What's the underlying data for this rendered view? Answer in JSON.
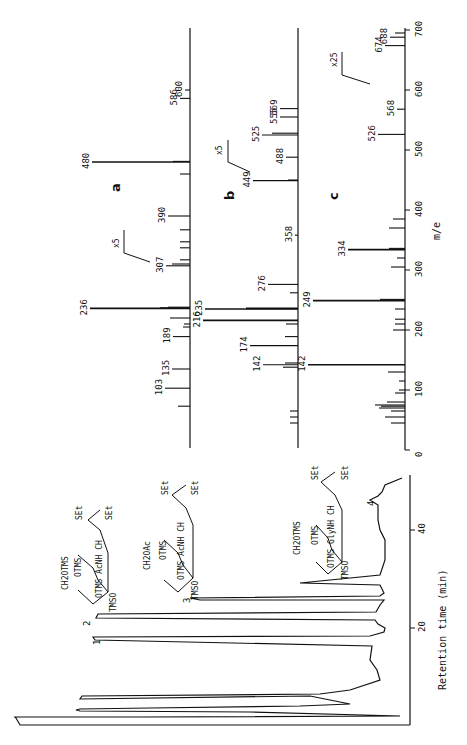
{
  "chart_data": [
    {
      "id": "gc",
      "type": "line",
      "title": "Gas chromatogram",
      "xlabel": "Retention time (min)",
      "ylabel": "",
      "x_ticks": [
        0,
        20,
        40
      ],
      "xlim": [
        0,
        50
      ],
      "peaks": [
        {
          "label": "1",
          "time": 9,
          "height": 0.93
        },
        {
          "label": "2",
          "time": 22,
          "height": 0.88
        },
        {
          "label": "3",
          "time": 26,
          "height": 0.62
        },
        {
          "label": "4",
          "time": 46,
          "height": 0.08
        }
      ],
      "structures": [
        {
          "peak": "2",
          "lines": [
            "CH2OTMS",
            "OTMS",
            "OTMS AcNH CH",
            "TMSO",
            "SEt",
            "SEt"
          ]
        },
        {
          "peak": "3",
          "lines": [
            "CH2OAc",
            "OTMS",
            "OTMS AcNH CH",
            "TMSO",
            "SEt",
            "SEt"
          ]
        },
        {
          "peak": "4",
          "lines": [
            "CH2OTMS",
            "OTMS",
            "OTMS GlyNH CH",
            "TMSO",
            "SEt",
            "SEt"
          ]
        }
      ]
    },
    {
      "id": "a",
      "type": "bar",
      "title": "a",
      "xlabel": "m/e",
      "annotation": "x5 (above m/e ~300)",
      "peaks": [
        {
          "mz": 73,
          "rel": 0.12
        },
        {
          "mz": 103,
          "rel": 0.25,
          "label": "103"
        },
        {
          "mz": 135,
          "rel": 0.18,
          "label": "135"
        },
        {
          "mz": 189,
          "rel": 0.17,
          "label": "189"
        },
        {
          "mz": 205,
          "rel": 0.07
        },
        {
          "mz": 210,
          "rel": 0.06
        },
        {
          "mz": 220,
          "rel": 0.2
        },
        {
          "mz": 236,
          "rel": 1.0,
          "label": "236"
        },
        {
          "mz": 237,
          "rel": 0.3
        },
        {
          "mz": 238,
          "rel": 0.22
        },
        {
          "mz": 307,
          "rel": 0.24,
          "label": "307"
        },
        {
          "mz": 310,
          "rel": 0.18
        },
        {
          "mz": 317,
          "rel": 0.1
        },
        {
          "mz": 337,
          "rel": 0.1
        },
        {
          "mz": 347,
          "rel": 0.1
        },
        {
          "mz": 367,
          "rel": 0.1
        },
        {
          "mz": 390,
          "rel": 0.22,
          "label": "390"
        },
        {
          "mz": 460,
          "rel": 0.1
        },
        {
          "mz": 480,
          "rel": 0.98,
          "label": "480"
        },
        {
          "mz": 481,
          "rel": 0.17
        },
        {
          "mz": 586,
          "rel": 0.1,
          "label": "586"
        },
        {
          "mz": 600,
          "rel": 0.05,
          "label": "600"
        }
      ]
    },
    {
      "id": "b",
      "type": "bar",
      "title": "b",
      "xlabel": "m/e",
      "annotation": "x5 (above m/e ~440)",
      "peaks": [
        {
          "mz": 45,
          "rel": 0.08
        },
        {
          "mz": 55,
          "rel": 0.08
        },
        {
          "mz": 65,
          "rel": 0.08
        },
        {
          "mz": 138,
          "rel": 0.15
        },
        {
          "mz": 142,
          "rel": 0.35,
          "label": "142"
        },
        {
          "mz": 145,
          "rel": 0.13
        },
        {
          "mz": 174,
          "rel": 0.48,
          "label": "174"
        },
        {
          "mz": 189,
          "rel": 0.13
        },
        {
          "mz": 210,
          "rel": 0.12
        },
        {
          "mz": 216,
          "rel": 0.95,
          "label": "216"
        },
        {
          "mz": 235,
          "rel": 0.93,
          "label": "235"
        },
        {
          "mz": 236,
          "rel": 0.52
        },
        {
          "mz": 262,
          "rel": 0.08
        },
        {
          "mz": 276,
          "rel": 0.3,
          "label": "276"
        },
        {
          "mz": 358,
          "rel": 0.03,
          "label": "358"
        },
        {
          "mz": 449,
          "rel": 0.45,
          "label": "449"
        },
        {
          "mz": 450,
          "rel": 0.1
        },
        {
          "mz": 488,
          "rel": 0.12,
          "label": "488"
        },
        {
          "mz": 525,
          "rel": 0.36,
          "label": "525"
        },
        {
          "mz": 528,
          "rel": 0.26
        },
        {
          "mz": 555,
          "rel": 0.18,
          "label": "555"
        },
        {
          "mz": 569,
          "rel": 0.18,
          "label": "569"
        }
      ]
    },
    {
      "id": "c",
      "type": "bar",
      "title": "c",
      "xlabel": "m/e",
      "x_ticks": [
        0,
        100,
        200,
        300,
        400,
        500,
        600,
        700
      ],
      "xlim": [
        0,
        700
      ],
      "annotation": "x25 (above m/e ~620)",
      "peaks": [
        {
          "mz": 45,
          "rel": 0.14
        },
        {
          "mz": 55,
          "rel": 0.2
        },
        {
          "mz": 65,
          "rel": 0.14
        },
        {
          "mz": 70,
          "rel": 0.26
        },
        {
          "mz": 73,
          "rel": 0.24
        },
        {
          "mz": 75,
          "rel": 0.3
        },
        {
          "mz": 80,
          "rel": 0.18
        },
        {
          "mz": 95,
          "rel": 0.1
        },
        {
          "mz": 100,
          "rel": 0.06
        },
        {
          "mz": 115,
          "rel": 0.06
        },
        {
          "mz": 130,
          "rel": 0.17
        },
        {
          "mz": 142,
          "rel": 0.97,
          "label": "142"
        },
        {
          "mz": 200,
          "rel": 0.12
        },
        {
          "mz": 210,
          "rel": 0.1
        },
        {
          "mz": 218,
          "rel": 0.1
        },
        {
          "mz": 235,
          "rel": 0.1
        },
        {
          "mz": 249,
          "rel": 0.92,
          "label": "249"
        },
        {
          "mz": 251,
          "rel": 0.25
        },
        {
          "mz": 305,
          "rel": 0.14
        },
        {
          "mz": 320,
          "rel": 0.08
        },
        {
          "mz": 334,
          "rel": 0.57,
          "label": "334"
        },
        {
          "mz": 336,
          "rel": 0.16
        },
        {
          "mz": 370,
          "rel": 0.16
        },
        {
          "mz": 385,
          "rel": 0.12
        },
        {
          "mz": 526,
          "rel": 0.27,
          "label": "526"
        },
        {
          "mz": 568,
          "rel": 0.08,
          "label": "568"
        },
        {
          "mz": 674,
          "rel": 0.2,
          "label": "674"
        },
        {
          "mz": 688,
          "rel": 0.15,
          "label": "688"
        },
        {
          "mz": 695,
          "rel": 0.1
        }
      ]
    }
  ],
  "labels": {
    "panel_a": "a",
    "panel_b": "b",
    "panel_c": "c",
    "mz_axis": "m/e",
    "rt_axis": "Retention time (min)",
    "x5_a": "x5",
    "x5_b": "x5",
    "x25_c": "x25",
    "peak1": "1",
    "peak2": "2",
    "peak3": "3",
    "peak4": "4",
    "rt_tick_20": "20",
    "rt_tick_40": "40",
    "mz_ticks": [
      "0",
      "100",
      "200",
      "300",
      "400",
      "500",
      "600",
      "700"
    ],
    "s2": {
      "ch2": "CH2OTMS",
      "otms": "OTMS",
      "mid": "OTMS AcNH CH",
      "tmso": "TMSO",
      "set1": "SEt",
      "set2": "SEt"
    },
    "s3": {
      "ch2": "CH2OAc",
      "otms": "OTMS",
      "mid": "OTMS AcNH CH",
      "tmso": "TMSO",
      "set1": "SEt",
      "set2": "SEt"
    },
    "s4": {
      "ch2": "CH2OTMS",
      "otms": "OTMS",
      "mid": "OTMS GlyNH CH",
      "tmso": "TMSO",
      "set1": "SEt",
      "set2": "SEt"
    }
  }
}
